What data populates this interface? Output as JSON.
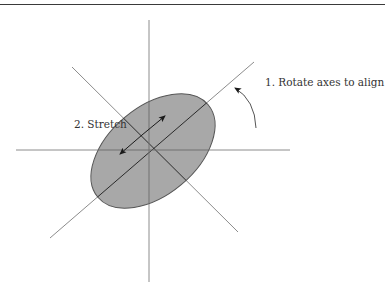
{
  "diagram": {
    "labels": {
      "rotate": "1. Rotate axes to align",
      "stretch": "2. Stretch"
    },
    "colors": {
      "axis": "#8c8c8c",
      "ellipse_fill": "#a8a8a8",
      "ellipse_stroke": "#555555",
      "major_axis": "#2a2a2a",
      "arrow": "#1a1a1a",
      "text": "#333333",
      "top_rule": "#3a3a3a"
    },
    "geometry": {
      "horizontal_axis": {
        "x1": 16,
        "y1": 150,
        "x2": 290,
        "y2": 150
      },
      "vertical_axis": {
        "x1": 149,
        "y1": 20,
        "x2": 149,
        "y2": 282
      },
      "diag_major": {
        "x1": 50,
        "y1": 238,
        "x2": 254,
        "y2": 62
      },
      "diag_minor": {
        "x1": 72,
        "y1": 67,
        "x2": 238,
        "y2": 232
      },
      "ellipse": {
        "cx": 153,
        "cy": 151,
        "rx": 72,
        "ry": 44,
        "rotation_deg": -40
      },
      "stretch_arrow": {
        "x1": 120,
        "y1": 154,
        "x2": 165,
        "y2": 116
      },
      "rotate_arc": {
        "start": [
          256,
          128
        ],
        "end": [
          234,
          87
        ]
      }
    }
  }
}
